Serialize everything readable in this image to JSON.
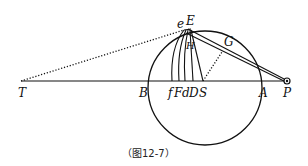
{
  "figure": {
    "caption": "（图12-7）",
    "colors": {
      "ink": "#111111",
      "background": "#ffffff"
    },
    "labels": {
      "T": "T",
      "B": "B",
      "f": "f",
      "F": "F",
      "d": "d",
      "D": "D",
      "S": "S",
      "A": "A",
      "P": "P",
      "e": "e",
      "E": "E",
      "G": "G",
      "H": "H"
    },
    "points": {
      "T": [
        21,
        81
      ],
      "B": [
        149,
        81
      ],
      "f": [
        172,
        81
      ],
      "F": [
        179,
        81
      ],
      "d": [
        185,
        81
      ],
      "D": [
        193,
        81
      ],
      "S": [
        203,
        81
      ],
      "A": [
        258,
        81
      ],
      "P": [
        288,
        81
      ],
      "E": [
        190,
        29
      ],
      "e": [
        184,
        30
      ],
      "G": [
        228,
        45
      ],
      "H": [
        190,
        45
      ]
    },
    "circle": {
      "cx": 205,
      "cy": 88,
      "r": 57
    }
  }
}
